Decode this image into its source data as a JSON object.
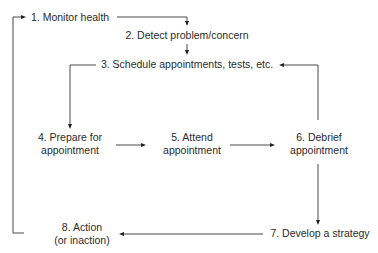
{
  "diagram": {
    "type": "flowchart-cycle",
    "colors": {
      "background": "#ffffff",
      "text": "#2b2b2b",
      "lines": "#333333"
    },
    "nodes": [
      {
        "id": "n1",
        "lines": [
          "1. Monitor health"
        ]
      },
      {
        "id": "n2",
        "lines": [
          "2. Detect problem/concern"
        ]
      },
      {
        "id": "n3",
        "lines": [
          "3. Schedule appointments, tests, etc."
        ]
      },
      {
        "id": "n4",
        "lines": [
          "4. Prepare for",
          "appointment"
        ]
      },
      {
        "id": "n5",
        "lines": [
          "5. Attend",
          "appointment"
        ]
      },
      {
        "id": "n6",
        "lines": [
          "6. Debrief",
          "appointment"
        ]
      },
      {
        "id": "n7",
        "lines": [
          "7. Develop a strategy"
        ]
      },
      {
        "id": "n8",
        "lines": [
          "8. Action",
          "(or inaction)"
        ]
      }
    ],
    "edges": [
      {
        "from": "n1",
        "to": "n2"
      },
      {
        "from": "n2",
        "to": "n3"
      },
      {
        "from": "n3",
        "to": "n4"
      },
      {
        "from": "n4",
        "to": "n5"
      },
      {
        "from": "n5",
        "to": "n6"
      },
      {
        "from": "n6",
        "to": "n3"
      },
      {
        "from": "n6",
        "to": "n7"
      },
      {
        "from": "n7",
        "to": "n8"
      },
      {
        "from": "n8",
        "to": "n1"
      }
    ]
  }
}
